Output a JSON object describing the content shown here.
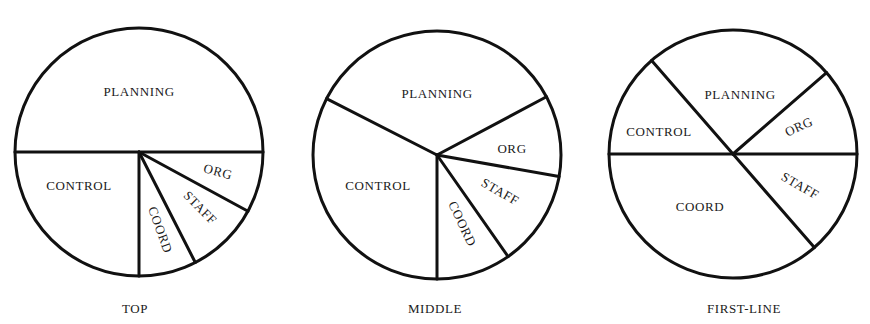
{
  "chart_data": [
    {
      "type": "pie",
      "title": "TOP",
      "categories": [
        "PLANNING",
        "ORG",
        "STAFF",
        "COORD",
        "CONTROL"
      ],
      "values": [
        50,
        8,
        9.5,
        7.5,
        25
      ],
      "unit": "percent (estimated from slice angles)",
      "center": [
        139,
        152
      ],
      "radius": 124,
      "boundaries_deg": [
        180,
        0,
        -28.5,
        -63,
        -90
      ],
      "labels": [
        {
          "text": "PLANNING",
          "x": 139,
          "y": 96,
          "rotate": 0
        },
        {
          "text": "ORG",
          "x": 218,
          "y": 176,
          "rotate": 15
        },
        {
          "text": "STAFF",
          "x": 200,
          "y": 212,
          "rotate": 45
        },
        {
          "text": "COORD",
          "x": 160,
          "y": 234,
          "rotate": 70
        },
        {
          "text": "CONTROL",
          "x": 79,
          "y": 190,
          "rotate": 0
        }
      ],
      "caption": {
        "text": "TOP",
        "x": 135,
        "y": 313
      }
    },
    {
      "type": "pie",
      "title": "MIDDLE",
      "categories": [
        "PLANNING",
        "ORG",
        "STAFF",
        "COORD",
        "CONTROL"
      ],
      "values": [
        35,
        10.5,
        12.5,
        10,
        32.5
      ],
      "unit": "percent (estimated from slice angles)",
      "center": [
        437,
        155
      ],
      "radius": 124,
      "boundaries_deg": [
        153,
        28,
        -10,
        -55,
        -90
      ],
      "labels": [
        {
          "text": "PLANNING",
          "x": 437,
          "y": 98,
          "rotate": 0
        },
        {
          "text": "ORG",
          "x": 512,
          "y": 153,
          "rotate": 0
        },
        {
          "text": "STAFF",
          "x": 500,
          "y": 196,
          "rotate": 30
        },
        {
          "text": "COORD",
          "x": 462,
          "y": 228,
          "rotate": 65
        },
        {
          "text": "CONTROL",
          "x": 378,
          "y": 190,
          "rotate": 0
        }
      ],
      "caption": {
        "text": "MIDDLE",
        "x": 435,
        "y": 313
      }
    },
    {
      "type": "pie",
      "title": "FIRST-LINE",
      "categories": [
        "PLANNING",
        "ORG",
        "STAFF",
        "COORD",
        "CONTROL"
      ],
      "values": [
        25,
        11.5,
        13.5,
        36.5,
        13.5
      ],
      "unit": "percent (estimated from slice angles)",
      "center": [
        733,
        154
      ],
      "radius": 124,
      "boundaries_deg": [
        131,
        41,
        0,
        -49,
        180
      ],
      "labels": [
        {
          "text": "PLANNING",
          "x": 740,
          "y": 99,
          "rotate": 0
        },
        {
          "text": "ORG",
          "x": 799,
          "y": 131,
          "rotate": -25
        },
        {
          "text": "STAFF",
          "x": 800,
          "y": 190,
          "rotate": 30
        },
        {
          "text": "COORD",
          "x": 700,
          "y": 211,
          "rotate": 0
        },
        {
          "text": "CONTROL",
          "x": 659,
          "y": 136,
          "rotate": 0
        }
      ],
      "caption": {
        "text": "FIRST-LINE",
        "x": 744,
        "y": 313
      }
    }
  ],
  "style": {
    "stroke_color": "#111111",
    "stroke_width": 3,
    "background": "#ffffff"
  }
}
